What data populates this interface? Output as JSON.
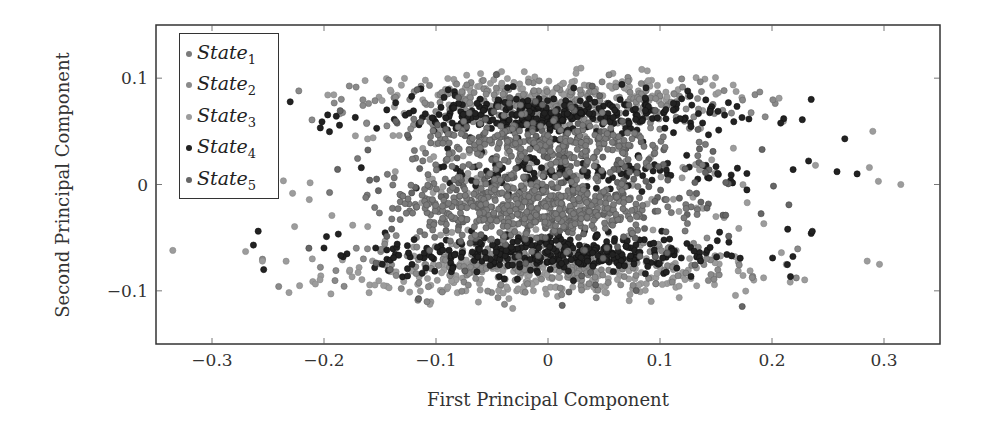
{
  "chart_data": {
    "type": "scatter",
    "title": "",
    "xlabel": "First Principal Component",
    "ylabel": "Second Principal Component",
    "xlim": [
      -0.35,
      0.35
    ],
    "ylim": [
      -0.15,
      0.15
    ],
    "xticks": [
      -0.3,
      -0.2,
      -0.1,
      0,
      0.1,
      0.2,
      0.3
    ],
    "xtick_labels": [
      "−0.3",
      "−0.2",
      "−0.1",
      "0",
      "0.1",
      "0.2",
      "0.3"
    ],
    "yticks": [
      0.1,
      0,
      -0.1
    ],
    "ytick_labels": [
      "0.1",
      "0",
      "−0.1"
    ],
    "grid": false,
    "legend_position": "upper left",
    "series": [
      {
        "name": "State",
        "subscript": "1",
        "color": "#7a7a7a",
        "edge": "#555555",
        "description": "dense central band around y=-0.02 and y=0.03",
        "clusters": [
          {
            "cx": -0.02,
            "cy": -0.02,
            "sx": 0.07,
            "sy": 0.014,
            "n": 500
          },
          {
            "cx": 0.0,
            "cy": 0.035,
            "sx": 0.07,
            "sy": 0.012,
            "n": 250
          }
        ]
      },
      {
        "name": "State",
        "subscript": "2",
        "color": "#8a8a8a",
        "edge": "#6a6a6a",
        "description": "wide upper and lower bands",
        "clusters": [
          {
            "cx": 0.0,
            "cy": 0.075,
            "sx": 0.1,
            "sy": 0.012,
            "n": 260
          },
          {
            "cx": 0.0,
            "cy": -0.075,
            "sx": 0.1,
            "sy": 0.012,
            "n": 260
          }
        ]
      },
      {
        "name": "State",
        "subscript": "3",
        "color": "#9c9c9c",
        "edge": "#8a8a8a",
        "description": "outermost light bands and spread",
        "clusters": [
          {
            "cx": 0.0,
            "cy": -0.085,
            "sx": 0.12,
            "sy": 0.012,
            "n": 260
          },
          {
            "cx": 0.0,
            "cy": 0.085,
            "sx": 0.11,
            "sy": 0.01,
            "n": 180
          },
          {
            "cx": 0.0,
            "cy": 0.0,
            "sx": 0.12,
            "sy": 0.04,
            "n": 200
          }
        ]
      },
      {
        "name": "State",
        "subscript": "4",
        "color": "#222222",
        "edge": "#111111",
        "description": "dark bands near y=+0.065 and y=-0.065, plus mid row near y=0.01",
        "clusters": [
          {
            "cx": 0.0,
            "cy": 0.065,
            "sx": 0.09,
            "sy": 0.01,
            "n": 320
          },
          {
            "cx": 0.0,
            "cy": -0.065,
            "sx": 0.09,
            "sy": 0.01,
            "n": 340
          },
          {
            "cx": 0.03,
            "cy": 0.012,
            "sx": 0.1,
            "sy": 0.01,
            "n": 120
          }
        ]
      },
      {
        "name": "State",
        "subscript": "5",
        "color": "#666666",
        "edge": "#444444",
        "description": "mid-grey scattered across the cloud",
        "clusters": [
          {
            "cx": 0.0,
            "cy": 0.0,
            "sx": 0.09,
            "sy": 0.045,
            "n": 260
          }
        ]
      }
    ],
    "outliers": [
      {
        "x": -0.335,
        "y": -0.062,
        "s": 2
      },
      {
        "x": -0.27,
        "y": -0.063,
        "s": 2
      },
      {
        "x": -0.263,
        "y": -0.057,
        "s": 3
      },
      {
        "x": -0.255,
        "y": -0.072,
        "s": 2
      },
      {
        "x": -0.245,
        "y": 0.063,
        "s": 2
      },
      {
        "x": 0.235,
        "y": 0.08,
        "s": 3
      },
      {
        "x": 0.265,
        "y": 0.043,
        "s": 3
      },
      {
        "x": 0.29,
        "y": 0.05,
        "s": 2
      },
      {
        "x": 0.258,
        "y": 0.012,
        "s": 3
      },
      {
        "x": 0.276,
        "y": 0.01,
        "s": 3
      },
      {
        "x": 0.287,
        "y": 0.016,
        "s": 2
      },
      {
        "x": 0.295,
        "y": 0.003,
        "s": 2
      },
      {
        "x": 0.315,
        "y": 0.0,
        "s": 2
      },
      {
        "x": 0.214,
        "y": -0.042,
        "s": 3
      },
      {
        "x": 0.235,
        "y": -0.046,
        "s": 3
      },
      {
        "x": 0.236,
        "y": -0.044,
        "s": 3
      },
      {
        "x": 0.285,
        "y": -0.072,
        "s": 2
      },
      {
        "x": 0.296,
        "y": -0.075,
        "s": 2
      }
    ]
  }
}
